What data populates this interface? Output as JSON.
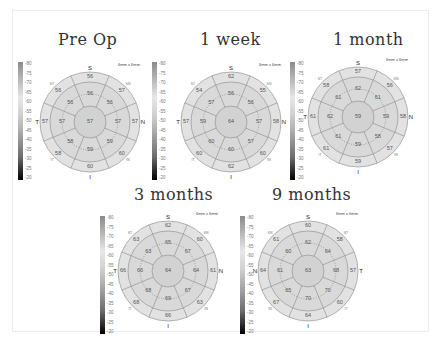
{
  "figure": {
    "colorbar_ticks": [
      "80",
      "75",
      "70",
      "65",
      "60",
      "55",
      "50",
      "45",
      "40",
      "35",
      "30",
      "25",
      "20"
    ],
    "scan_size": "6mm x 6mm",
    "panels": [
      {
        "title": "Pre Op",
        "eye": "right",
        "orient": {
          "top": "S",
          "bottom": "I",
          "left": "T",
          "right": "N"
        },
        "quad": {
          "tl": "ST",
          "tr": "SN",
          "bl": "IT",
          "br": "IN"
        },
        "center": "57",
        "inner": [
          "56",
          "56",
          "57",
          "59",
          "59",
          "58",
          "57",
          "56"
        ],
        "outer": [
          "56",
          "57",
          "57",
          "60",
          "60",
          "58",
          "57",
          "56"
        ]
      },
      {
        "title": "1 week",
        "eye": "right",
        "orient": {
          "top": "S",
          "bottom": "I",
          "left": "T",
          "right": "N"
        },
        "quad": {
          "tl": "ST",
          "tr": "SN",
          "bl": "IT",
          "br": "IN"
        },
        "center": "64",
        "inner": [
          "56",
          "56",
          "57",
          "57",
          "60",
          "60",
          "59",
          "57"
        ],
        "outer": [
          "62",
          "55",
          "58",
          "60",
          "62",
          "60",
          "57",
          "54"
        ]
      },
      {
        "title": "1 month",
        "eye": "right",
        "orient": {
          "top": "S",
          "bottom": "I",
          "left": "T",
          "right": "N"
        },
        "quad": {
          "tl": "ST",
          "tr": "SN",
          "bl": "IT",
          "br": "IN"
        },
        "center": "59",
        "inner": [
          "62",
          "61",
          "59",
          "58",
          "59",
          "61",
          "62",
          "61"
        ],
        "outer": [
          "57",
          "56",
          "58",
          "57",
          "59",
          "61",
          "61",
          "58"
        ]
      },
      {
        "title": "3 months",
        "eye": "right",
        "orient": {
          "top": "S",
          "bottom": "I",
          "left": "T",
          "right": "N"
        },
        "quad": {
          "tl": "ST",
          "tr": "SN",
          "bl": "IT",
          "br": "IN"
        },
        "center": "64",
        "inner": [
          "65",
          "67",
          "64",
          "67",
          "69",
          "68",
          "66",
          "63"
        ],
        "outer": [
          "62",
          "60",
          "61",
          "63",
          "66",
          "68",
          "66",
          "63"
        ]
      },
      {
        "title": "9 months",
        "eye": "left",
        "orient": {
          "top": "S",
          "bottom": "I",
          "left": "N",
          "right": "T"
        },
        "quad": {
          "tl": "SN",
          "tr": "ST",
          "bl": "IN",
          "br": "IT"
        },
        "center": "63",
        "inner": [
          "62",
          "64",
          "68",
          "70",
          "70",
          "65",
          "61",
          "60"
        ],
        "outer": [
          "60",
          "58",
          "57",
          "60",
          "64",
          "67",
          "64",
          "61"
        ]
      }
    ]
  }
}
